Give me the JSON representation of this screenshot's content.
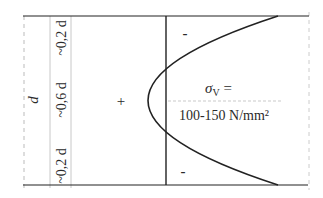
{
  "diagram": {
    "labels": {
      "depth": "d",
      "mid_zone": "~0,6 d",
      "top_zone": "~0,2 d",
      "bottom_zone": "~0,2 d",
      "sign_top": "-",
      "sign_bottom": "-",
      "sign_middle": "+",
      "stress_symbol": "σ",
      "stress_subscript": "V",
      "stress_equals": " =",
      "stress_value": "100-150 N/mm²"
    },
    "colors": {
      "line": "#222222",
      "guide": "#bbbbbb",
      "text": "#2a2a2a",
      "background": "#ffffff"
    }
  }
}
